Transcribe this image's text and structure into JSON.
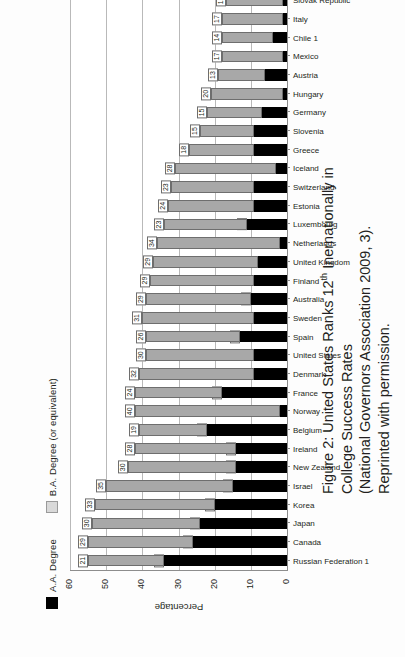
{
  "figure": {
    "caption_prefix": "Figure 2: United States Ranks 12",
    "caption_sup": "th",
    "caption_rest": " Inernationally in College Success Rates",
    "caption_line2": "(National Governors Association 2009, 3). Reprinted with permission.",
    "orientation": "rotated-90-ccw"
  },
  "legend": {
    "items": [
      {
        "label": "A.A. Degree",
        "color": "#000000",
        "key": "aa"
      },
      {
        "label": "B.A. Degree (or equivalent)",
        "color": "#d9d9d9",
        "key": "ba"
      }
    ]
  },
  "axis": {
    "value_axis_title": "Percentage",
    "value_ticks": [
      0,
      10,
      20,
      30,
      40,
      50,
      60
    ],
    "value_min": 0,
    "value_max": 60
  },
  "chart_data": {
    "type": "bar",
    "subtype": "stacked-horizontal",
    "title": "United States Ranks 12th Inernationally in College Success Rates",
    "xlabel": "",
    "ylabel": "Percentage",
    "ylim": [
      0,
      60
    ],
    "grid": true,
    "legend_position": "top-left",
    "categories": [
      "Russian Federation 1",
      "Canada",
      "Japan",
      "Korea",
      "Israel",
      "New Zealand",
      "Ireland",
      "Belgium",
      "Norway",
      "France",
      "Denmark",
      "United States",
      "Spain",
      "Sweden",
      "Australia",
      "Finland",
      "United Kingdom",
      "Netherlands",
      "Luxembourg",
      "Estonia",
      "Switzerland",
      "Iceland",
      "Greece",
      "Slovenia",
      "Germany",
      "Hungary",
      "Austria",
      "Mexico",
      "Chile 1",
      "Italy",
      "Slovak Republic"
    ],
    "series": [
      {
        "name": "A.A. Degree",
        "color": "#000000",
        "values": [
          34,
          26,
          24,
          20,
          15,
          14,
          14,
          22,
          2,
          18,
          9,
          9,
          13,
          9,
          10,
          9,
          8,
          2,
          11,
          9,
          9,
          3,
          9,
          9,
          7,
          1,
          6,
          1,
          4,
          1,
          1
        ]
      },
      {
        "name": "B.A. Degree (or equivalent)",
        "color": "#a8a8a8",
        "values": [
          21,
          29,
          30,
          33,
          35,
          30,
          28,
          19,
          40,
          24,
          32,
          30,
          26,
          31,
          29,
          29,
          29,
          34,
          23,
          24,
          23,
          28,
          18,
          15,
          15,
          20,
          13,
          17,
          14,
          17,
          16
        ]
      }
    ]
  }
}
